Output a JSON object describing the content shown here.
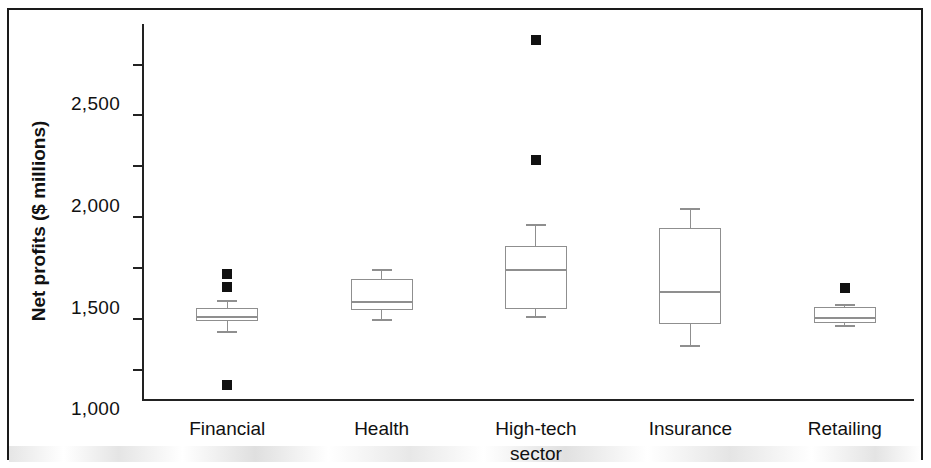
{
  "chart_data": {
    "type": "box",
    "title": "",
    "xlabel": "",
    "ylabel": "Net profits ($ millions)",
    "ylim": [
      -800,
      2900
    ],
    "yticks": [
      2500,
      2000,
      1500,
      1000,
      500,
      0,
      -500
    ],
    "ytick_labels": [
      "2,500",
      "2,000",
      "1,500",
      "1,000",
      "500",
      "0",
      "-500"
    ],
    "grid": false,
    "legend": "none",
    "categories": [
      "Financial",
      "Health",
      "High-tech sector",
      "Insurance",
      "Retailing"
    ],
    "category_label_lines": [
      [
        "Financial"
      ],
      [
        "Health"
      ],
      [
        "High-tech",
        "sector"
      ],
      [
        "Insurance"
      ],
      [
        "Retailing"
      ]
    ],
    "boxes": [
      {
        "name": "Financial",
        "whisker_low": -120,
        "q1": -20,
        "median": 15,
        "q3": 105,
        "whisker_high": 185,
        "outliers": [
          440,
          310,
          -650
        ]
      },
      {
        "name": "Health",
        "whisker_low": 0,
        "q1": 85,
        "median": 165,
        "q3": 390,
        "whisker_high": 485,
        "outliers": []
      },
      {
        "name": "High-tech sector",
        "whisker_low": 30,
        "q1": 100,
        "median": 480,
        "q3": 720,
        "whisker_high": 930,
        "outliers": [
          2740,
          1560
        ]
      },
      {
        "name": "Insurance",
        "whisker_low": -255,
        "q1": -50,
        "median": 265,
        "q3": 895,
        "whisker_high": 1085,
        "outliers": []
      },
      {
        "name": "Retailing",
        "whisker_low": -65,
        "q1": -45,
        "median": 5,
        "q3": 115,
        "whisker_high": 140,
        "outliers": [
          300
        ]
      }
    ],
    "colors": {
      "box_stroke": "#8f8f8f",
      "outlier_fill": "#111111",
      "axis": "#222222",
      "text": "#111111",
      "background": "#ffffff"
    }
  }
}
